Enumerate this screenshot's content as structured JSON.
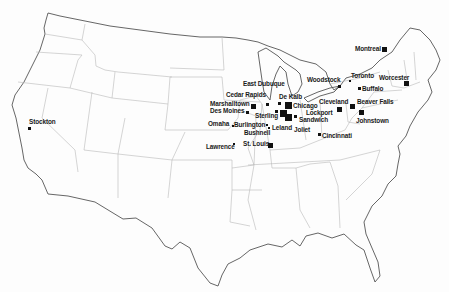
{
  "map": {
    "region": "United States (contiguous) with southern Canada",
    "marker_color": "#111111",
    "border_color": "#555555",
    "state_line_color": "#b8b8b8"
  },
  "cities": [
    {
      "name": "Montreal",
      "label": "Montreal",
      "size": "md"
    },
    {
      "name": "Toronto",
      "label": "Toronto",
      "size": "xs"
    },
    {
      "name": "Worcester",
      "label": "Worcester",
      "size": "md"
    },
    {
      "name": "Woodstock",
      "label": "Woodstock",
      "size": "sm"
    },
    {
      "name": "Buffalo",
      "label": "Buffalo",
      "size": "sm"
    },
    {
      "name": "Cleveland",
      "label": "Cleveland",
      "size": "md"
    },
    {
      "name": "Beaver Falls",
      "label": "Beaver Falls",
      "size": "md"
    },
    {
      "name": "Johnstown",
      "label": "Johnstown",
      "size": "md"
    },
    {
      "name": "Cincinnati",
      "label": "Cincinnati",
      "size": "sm"
    },
    {
      "name": "East Dubuque",
      "label": "East Dubuque",
      "size": "sm"
    },
    {
      "name": "De Kalb",
      "label": "De Kalb",
      "size": "sm"
    },
    {
      "name": "Chicago",
      "label": "Chicago",
      "size": "lg"
    },
    {
      "name": "Lockport",
      "label": "Lockport",
      "size": "sm"
    },
    {
      "name": "Sandwich",
      "label": "Sandwich",
      "size": "lg"
    },
    {
      "name": "Joliet",
      "label": "Joliet",
      "size": "sm"
    },
    {
      "name": "Sterling",
      "label": "Sterling",
      "size": "sm"
    },
    {
      "name": "Leland",
      "label": "Leland",
      "size": "lg"
    },
    {
      "name": "Cedar Rapids",
      "label": "Cedar Rapids",
      "size": "md"
    },
    {
      "name": "Marshalltown",
      "label": "Marshalltown",
      "size": "md"
    },
    {
      "name": "Des Moines",
      "label": "Des Moines",
      "size": "sm"
    },
    {
      "name": "Omaha",
      "label": "Omaha",
      "size": "xs"
    },
    {
      "name": "Burlington",
      "label": "Burlington",
      "size": "xs"
    },
    {
      "name": "Bushnell",
      "label": "Bushnell",
      "size": "xs"
    },
    {
      "name": "St. Louis",
      "label": "St. Louis",
      "size": "md"
    },
    {
      "name": "Lawrence",
      "label": "Lawrence",
      "size": "xs"
    },
    {
      "name": "Stockton",
      "label": "Stockton",
      "size": "sm"
    }
  ]
}
